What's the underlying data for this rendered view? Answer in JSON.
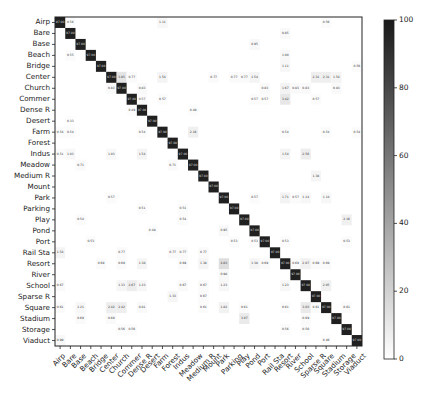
{
  "chart_data": {
    "type": "heatmap",
    "title": "",
    "xlabel": "",
    "ylabel": "",
    "labels": [
      "Airp",
      "Bare",
      "Base",
      "Beach",
      "Bridge",
      "Center",
      "Church",
      "Commer",
      "Dense R",
      "Desert",
      "Farm",
      "Forest",
      "Indus",
      "Meadow",
      "Medium R",
      "Mount",
      "Park",
      "Parking",
      "Play",
      "Pond",
      "Port",
      "Rail Sta",
      "Resort",
      "River",
      "School",
      "Sparse R",
      "Square",
      "Stadium",
      "Storage",
      "Viaduct"
    ],
    "diagonal_approx": 97,
    "diagonal_note": "diagonal cells are dark (high %), values illegible",
    "off_diagonal": [
      {
        "r": 0,
        "c": 1,
        "v": 0.56
      },
      {
        "r": 0,
        "c": 10,
        "v": 1.11
      },
      {
        "r": 0,
        "c": 26,
        "v": 0.56
      },
      {
        "r": 1,
        "c": 22,
        "v": 0.85
      },
      {
        "r": 2,
        "c": 19,
        "v": 0.95
      },
      {
        "r": 3,
        "c": 1,
        "v": 0.55
      },
      {
        "r": 3,
        "c": 22,
        "v": 1.0
      },
      {
        "r": 4,
        "c": 22,
        "v": 1.11
      },
      {
        "r": 4,
        "c": 29,
        "v": 0.56
      },
      {
        "r": 5,
        "c": 6,
        "v": 3.85
      },
      {
        "r": 5,
        "c": 7,
        "v": 0.77
      },
      {
        "r": 5,
        "c": 10,
        "v": 1.54
      },
      {
        "r": 5,
        "c": 15,
        "v": 0.77
      },
      {
        "r": 5,
        "c": 17,
        "v": 0.77
      },
      {
        "r": 5,
        "c": 18,
        "v": 0.77
      },
      {
        "r": 5,
        "c": 19,
        "v": 1.54
      },
      {
        "r": 5,
        "c": 25,
        "v": 2.31
      },
      {
        "r": 5,
        "c": 26,
        "v": 2.31
      },
      {
        "r": 5,
        "c": 27,
        "v": 1.54
      },
      {
        "r": 6,
        "c": 5,
        "v": 0.83
      },
      {
        "r": 6,
        "c": 8,
        "v": 0.83
      },
      {
        "r": 6,
        "c": 20,
        "v": 0.83
      },
      {
        "r": 6,
        "c": 22,
        "v": 1.67
      },
      {
        "r": 6,
        "c": 23,
        "v": 0.83
      },
      {
        "r": 6,
        "c": 24,
        "v": 0.83
      },
      {
        "r": 6,
        "c": 27,
        "v": 0.83
      },
      {
        "r": 7,
        "c": 8,
        "v": 0.57
      },
      {
        "r": 7,
        "c": 10,
        "v": 0.57
      },
      {
        "r": 7,
        "c": 19,
        "v": 0.57
      },
      {
        "r": 7,
        "c": 20,
        "v": 0.57
      },
      {
        "r": 7,
        "c": 22,
        "v": 3.42
      },
      {
        "r": 7,
        "c": 25,
        "v": 0.57
      },
      {
        "r": 8,
        "c": 7,
        "v": 0.49
      },
      {
        "r": 8,
        "c": 13,
        "v": 0.49
      },
      {
        "r": 9,
        "c": 1,
        "v": 0.33
      },
      {
        "r": 10,
        "c": 0,
        "v": 0.54
      },
      {
        "r": 10,
        "c": 1,
        "v": 0.54
      },
      {
        "r": 10,
        "c": 8,
        "v": 0.54
      },
      {
        "r": 10,
        "c": 13,
        "v": 2.16
      },
      {
        "r": 10,
        "c": 22,
        "v": 0.54
      },
      {
        "r": 10,
        "c": 26,
        "v": 0.54
      },
      {
        "r": 10,
        "c": 29,
        "v": 0.54
      },
      {
        "r": 12,
        "c": 0,
        "v": 0.51
      },
      {
        "r": 12,
        "c": 1,
        "v": 1.03
      },
      {
        "r": 12,
        "c": 5,
        "v": 1.03
      },
      {
        "r": 12,
        "c": 8,
        "v": 1.54
      },
      {
        "r": 12,
        "c": 22,
        "v": 1.54
      },
      {
        "r": 12,
        "c": 24,
        "v": 2.56
      },
      {
        "r": 13,
        "c": 2,
        "v": 0.71
      },
      {
        "r": 13,
        "c": 11,
        "v": 0.71
      },
      {
        "r": 14,
        "c": 25,
        "v": 1.38
      },
      {
        "r": 16,
        "c": 5,
        "v": 0.57
      },
      {
        "r": 16,
        "c": 19,
        "v": 0.57
      },
      {
        "r": 16,
        "c": 22,
        "v": 1.71
      },
      {
        "r": 16,
        "c": 23,
        "v": 0.57
      },
      {
        "r": 16,
        "c": 24,
        "v": 1.14
      },
      {
        "r": 16,
        "c": 26,
        "v": 1.14
      },
      {
        "r": 17,
        "c": 8,
        "v": 0.51
      },
      {
        "r": 17,
        "c": 12,
        "v": 0.51
      },
      {
        "r": 18,
        "c": 2,
        "v": 0.54
      },
      {
        "r": 18,
        "c": 12,
        "v": 0.54
      },
      {
        "r": 18,
        "c": 28,
        "v": 2.16
      },
      {
        "r": 19,
        "c": 9,
        "v": 0.48
      },
      {
        "r": 19,
        "c": 16,
        "v": 0.95
      },
      {
        "r": 20,
        "c": 3,
        "v": 0.53
      },
      {
        "r": 20,
        "c": 17,
        "v": 0.53
      },
      {
        "r": 20,
        "c": 19,
        "v": 0.53
      },
      {
        "r": 20,
        "c": 22,
        "v": 0.53
      },
      {
        "r": 20,
        "c": 28,
        "v": 0.53
      },
      {
        "r": 21,
        "c": 0,
        "v": 1.54
      },
      {
        "r": 21,
        "c": 6,
        "v": 0.77
      },
      {
        "r": 21,
        "c": 11,
        "v": 0.77
      },
      {
        "r": 21,
        "c": 12,
        "v": 0.77
      },
      {
        "r": 21,
        "c": 14,
        "v": 0.77
      },
      {
        "r": 22,
        "c": 4,
        "v": 0.69
      },
      {
        "r": 22,
        "c": 6,
        "v": 0.69
      },
      {
        "r": 22,
        "c": 8,
        "v": 1.38
      },
      {
        "r": 22,
        "c": 12,
        "v": 0.69
      },
      {
        "r": 22,
        "c": 14,
        "v": 1.38
      },
      {
        "r": 22,
        "c": 16,
        "v": 4.83
      },
      {
        "r": 22,
        "c": 19,
        "v": 1.38
      },
      {
        "r": 22,
        "c": 20,
        "v": 0.69
      },
      {
        "r": 22,
        "c": 23,
        "v": 0.69
      },
      {
        "r": 22,
        "c": 24,
        "v": 2.07
      },
      {
        "r": 22,
        "c": 25,
        "v": 0.69
      },
      {
        "r": 22,
        "c": 26,
        "v": 0.69
      },
      {
        "r": 23,
        "c": 16,
        "v": 0.98
      },
      {
        "r": 24,
        "c": 0,
        "v": 0.67
      },
      {
        "r": 24,
        "c": 6,
        "v": 1.33
      },
      {
        "r": 24,
        "c": 7,
        "v": 2.67
      },
      {
        "r": 24,
        "c": 8,
        "v": 1.23
      },
      {
        "r": 24,
        "c": 12,
        "v": 0.67
      },
      {
        "r": 24,
        "c": 14,
        "v": 0.67
      },
      {
        "r": 24,
        "c": 16,
        "v": 1.23
      },
      {
        "r": 24,
        "c": 22,
        "v": 1.23
      },
      {
        "r": 24,
        "c": 26,
        "v": 2.05
      },
      {
        "r": 25,
        "c": 11,
        "v": 1.33
      },
      {
        "r": 25,
        "c": 14,
        "v": 0.67
      },
      {
        "r": 26,
        "c": 0,
        "v": 0.61
      },
      {
        "r": 26,
        "c": 2,
        "v": 1.21
      },
      {
        "r": 26,
        "c": 5,
        "v": 2.42
      },
      {
        "r": 26,
        "c": 6,
        "v": 2.42
      },
      {
        "r": 26,
        "c": 8,
        "v": 0.81
      },
      {
        "r": 26,
        "c": 14,
        "v": 0.61
      },
      {
        "r": 26,
        "c": 16,
        "v": 1.82
      },
      {
        "r": 26,
        "c": 18,
        "v": 0.61
      },
      {
        "r": 26,
        "c": 22,
        "v": 0.61
      },
      {
        "r": 26,
        "c": 24,
        "v": 3.03
      },
      {
        "r": 26,
        "c": 25,
        "v": 0.61
      },
      {
        "r": 26,
        "c": 28,
        "v": 0.61
      },
      {
        "r": 27,
        "c": 2,
        "v": 0.69
      },
      {
        "r": 27,
        "c": 5,
        "v": 0.69
      },
      {
        "r": 27,
        "c": 18,
        "v": 3.07
      },
      {
        "r": 27,
        "c": 24,
        "v": 0.69
      },
      {
        "r": 28,
        "c": 6,
        "v": 0.56
      },
      {
        "r": 28,
        "c": 7,
        "v": 0.56
      },
      {
        "r": 28,
        "c": 22,
        "v": 0.56
      },
      {
        "r": 28,
        "c": 24,
        "v": 0.56
      },
      {
        "r": 29,
        "c": 0,
        "v": 0.99
      },
      {
        "r": 29,
        "c": 26,
        "v": 0.46
      }
    ],
    "colorbar": {
      "min": 0,
      "max": 100,
      "ticks": [
        0,
        20,
        40,
        60,
        80,
        100
      ],
      "cmap": "Greys"
    },
    "legend_position": "right colorbar"
  }
}
